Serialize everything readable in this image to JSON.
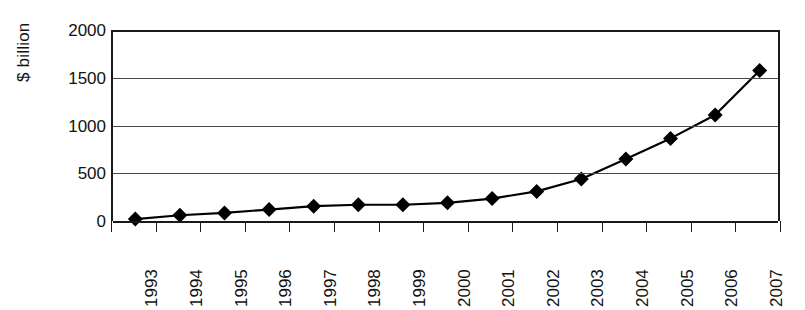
{
  "chart_data": {
    "type": "line",
    "title": "",
    "xlabel": "",
    "ylabel": "$ billion",
    "categories": [
      "1993",
      "1994",
      "1995",
      "1996",
      "1997",
      "1998",
      "1999",
      "2000",
      "2001",
      "2002",
      "2003",
      "2004",
      "2005",
      "2006",
      "2007"
    ],
    "values": [
      20,
      60,
      85,
      120,
      155,
      170,
      170,
      190,
      235,
      310,
      440,
      650,
      865,
      1110,
      1575
    ],
    "series": [
      {
        "name": "$ billion",
        "values": [
          20,
          60,
          85,
          120,
          155,
          170,
          170,
          190,
          235,
          310,
          440,
          650,
          865,
          1110,
          1575
        ]
      }
    ],
    "ylim": [
      0,
      2000
    ],
    "y_ticks": [
      0,
      500,
      1000,
      1500,
      2000
    ],
    "y_tick_labels": [
      "0",
      "500",
      "1000",
      "1500",
      "2000"
    ],
    "grid": "horizontal",
    "legend": "none",
    "marker": "diamond",
    "marker_color": "#000000",
    "line_color": "#000000",
    "axis_color": "#1a1a1a",
    "gridline_color": "#4a4a4a",
    "background_color": "#ffffff",
    "x_label_rotation": -90
  }
}
